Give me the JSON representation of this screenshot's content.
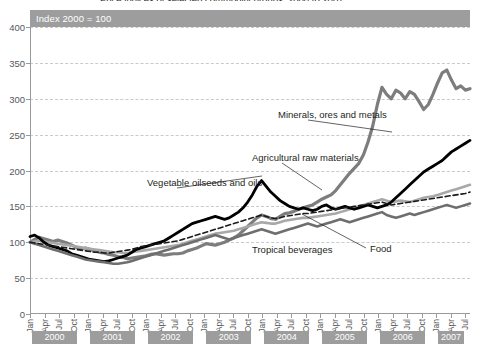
{
  "title_cut": "Price indices of selected commodity groups, 2000 to 2007",
  "index_note": "Index 2000 = 100",
  "yaxis": {
    "ticks": [
      0,
      50,
      100,
      150,
      200,
      250,
      300,
      350,
      400
    ],
    "min": 0,
    "max": 400
  },
  "quarter_labels": [
    "Jan",
    "Apr",
    "Jul",
    "Oct"
  ],
  "years": [
    "2000",
    "2001",
    "2002",
    "2003",
    "2004",
    "2005",
    "2006",
    "2007"
  ],
  "annotations": [
    {
      "name": "minerals",
      "text": "Minerals, ores and metals",
      "x": 278,
      "y": 109
    },
    {
      "name": "agricultural",
      "text": "Agricultural raw materials",
      "x": 252,
      "y": 152
    },
    {
      "name": "vegetable-oils",
      "text": "Vegetable oilseeds and oils",
      "x": 147,
      "y": 177
    },
    {
      "name": "tropical-beverages",
      "text": "Tropical beverages",
      "x": 252,
      "y": 244
    },
    {
      "name": "food",
      "text": "Food",
      "x": 370,
      "y": 243
    }
  ],
  "colors": {
    "minerals": "#7d7d7d",
    "agricultural": "#a8a8a8",
    "vegetable_oils": "#000000",
    "tropical_beverages": "#6e6e6e",
    "food": "#1a1a1a",
    "band": "#9d9d9d",
    "grid": "#c9c9cf",
    "axis": "#9a9a9a",
    "text": "#231f20",
    "tick_text": "#58585a"
  },
  "chart_data": {
    "type": "line",
    "title": "Price indices of selected commodity groups, 2000 to 2007",
    "subtitle": "Index 2000 = 100",
    "xlabel": "",
    "ylabel": "",
    "ylim": [
      0,
      400
    ],
    "grid": true,
    "legend": "annotations-inline",
    "x_start": "2000-01",
    "x_end": "2007-08",
    "x_frequency": "monthly",
    "x_tick_labels": [
      "Jan",
      "Apr",
      "Jul",
      "Oct"
    ],
    "series": [
      {
        "name": "Minerals, ores and metals",
        "style": "solid-thick",
        "color": "#7d7d7d",
        "values": [
          100,
          104,
          107,
          105,
          103,
          101,
          103,
          101,
          99,
          96,
          93,
          91,
          92,
          90,
          88,
          86,
          85,
          83,
          82,
          80,
          79,
          77,
          78,
          79,
          80,
          81,
          83,
          84,
          83,
          82,
          83,
          84,
          84,
          85,
          88,
          90,
          92,
          95,
          98,
          97,
          96,
          98,
          100,
          103,
          106,
          110,
          116,
          122,
          128,
          134,
          138,
          136,
          133,
          132,
          136,
          140,
          141,
          143,
          146,
          148,
          150,
          152,
          156,
          160,
          163,
          166,
          172,
          180,
          188,
          196,
          203,
          210,
          222,
          240,
          262,
          292,
          316,
          306,
          300,
          312,
          308,
          300,
          310,
          306,
          296,
          285,
          292,
          306,
          322,
          336,
          340,
          326,
          314,
          318,
          312,
          314
        ]
      },
      {
        "name": "Agricultural raw materials",
        "style": "solid-medium",
        "color": "#a8a8a8",
        "values": [
          100,
          101,
          102,
          101,
          100,
          99,
          98,
          97,
          96,
          95,
          94,
          93,
          92,
          91,
          90,
          89,
          88,
          87,
          86,
          86,
          85,
          85,
          86,
          87,
          88,
          89,
          90,
          91,
          92,
          93,
          94,
          95,
          96,
          98,
          100,
          102,
          104,
          106,
          108,
          110,
          112,
          113,
          114,
          115,
          116,
          118,
          120,
          122,
          124,
          126,
          128,
          127,
          126,
          126,
          128,
          130,
          131,
          132,
          133,
          134,
          134,
          135,
          136,
          137,
          138,
          139,
          140,
          142,
          144,
          146,
          148,
          150,
          152,
          154,
          156,
          158,
          160,
          158,
          156,
          157,
          158,
          157,
          156,
          158,
          160,
          162,
          163,
          164,
          166,
          168,
          170,
          172,
          174,
          176,
          178,
          180
        ]
      },
      {
        "name": "Vegetable oilseeds and oils",
        "style": "solid-thick-black",
        "color": "#000000",
        "values": [
          108,
          110,
          106,
          100,
          96,
          94,
          92,
          90,
          88,
          84,
          82,
          80,
          78,
          76,
          75,
          74,
          73,
          74,
          76,
          78,
          80,
          82,
          86,
          90,
          92,
          94,
          96,
          98,
          100,
          102,
          106,
          110,
          114,
          118,
          122,
          126,
          128,
          130,
          132,
          134,
          136,
          134,
          132,
          134,
          138,
          142,
          148,
          156,
          166,
          178,
          186,
          178,
          170,
          164,
          158,
          154,
          150,
          148,
          146,
          148,
          146,
          144,
          146,
          150,
          152,
          148,
          146,
          148,
          150,
          148,
          146,
          148,
          150,
          152,
          150,
          148,
          150,
          152,
          156,
          162,
          168,
          174,
          180,
          186,
          192,
          198,
          202,
          206,
          210,
          214,
          220,
          226,
          230,
          234,
          238,
          242
        ]
      },
      {
        "name": "Tropical beverages",
        "style": "solid-medium-dark",
        "color": "#6e6e6e",
        "values": [
          100,
          98,
          96,
          94,
          92,
          90,
          88,
          86,
          84,
          82,
          80,
          78,
          76,
          75,
          74,
          73,
          72,
          71,
          70,
          70,
          71,
          72,
          74,
          76,
          78,
          80,
          82,
          84,
          86,
          88,
          90,
          92,
          94,
          96,
          98,
          100,
          102,
          104,
          106,
          108,
          110,
          108,
          106,
          104,
          106,
          108,
          110,
          112,
          114,
          116,
          118,
          116,
          114,
          112,
          114,
          116,
          118,
          120,
          122,
          124,
          126,
          124,
          122,
          124,
          126,
          128,
          130,
          132,
          130,
          128,
          130,
          132,
          134,
          136,
          138,
          140,
          142,
          138,
          136,
          134,
          136,
          138,
          140,
          138,
          140,
          142,
          144,
          146,
          148,
          150,
          152,
          150,
          148,
          150,
          152,
          154
        ]
      },
      {
        "name": "Food",
        "style": "dashed",
        "color": "#1a1a1a",
        "values": [
          100,
          99,
          98,
          97,
          96,
          95,
          94,
          93,
          92,
          91,
          90,
          89,
          88,
          87,
          86,
          86,
          85,
          85,
          86,
          87,
          88,
          89,
          90,
          92,
          94,
          95,
          96,
          97,
          98,
          99,
          100,
          101,
          102,
          104,
          106,
          108,
          110,
          112,
          114,
          116,
          118,
          120,
          122,
          124,
          126,
          128,
          130,
          132,
          134,
          136,
          138,
          136,
          134,
          133,
          134,
          136,
          137,
          138,
          139,
          140,
          140,
          141,
          142,
          143,
          144,
          145,
          146,
          147,
          148,
          149,
          150,
          151,
          152,
          153,
          154,
          155,
          156,
          154,
          152,
          153,
          154,
          155,
          156,
          157,
          158,
          159,
          160,
          161,
          162,
          163,
          164,
          165,
          166,
          167,
          168,
          170
        ]
      }
    ]
  }
}
